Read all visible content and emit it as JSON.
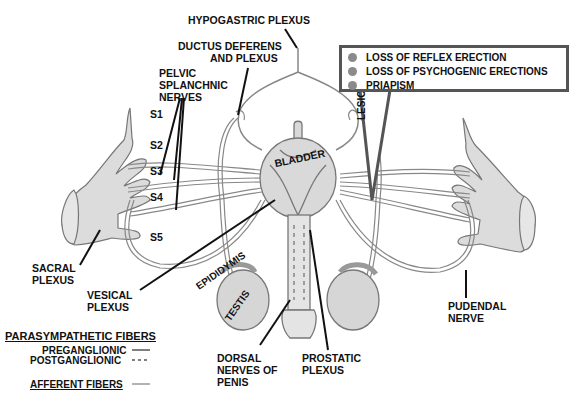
{
  "labels": {
    "hypogastric_plexus": "HYPOGASTRIC PLEXUS",
    "ductus_deferens_1": "DUCTUS DEFERENS",
    "ductus_deferens_2": "AND PLEXUS",
    "pelvic_1": "PELVIC",
    "pelvic_2": "SPLANCHNIC",
    "pelvic_3": "NERVES",
    "s1": "S1",
    "s2": "S2",
    "s3": "S3",
    "s4": "S4",
    "s5": "S5",
    "sacral_1": "SACRAL",
    "sacral_2": "PLEXUS",
    "vesical_1": "VESICAL",
    "vesical_2": "PLEXUS",
    "bladder": "BLADDER",
    "epididymis": "EPIDIDYMIS",
    "testis": "TESTIS",
    "lesion": "LESION",
    "dorsal_1": "DORSAL",
    "dorsal_2": "NERVES OF",
    "dorsal_3": "PENIS",
    "prostatic_1": "PROSTATIC",
    "prostatic_2": "PLEXUS",
    "pudendal_1": "PUDENDAL",
    "pudendal_2": "NERVE"
  },
  "lesion_effects": [
    "LOSS OF REFLEX ERECTION",
    "LOSS OF PSYCHOGENIC ERECTIONS",
    "PRIAPISM"
  ],
  "legend": {
    "parasympathetic_title": "PARASYMPATHETIC FIBERS",
    "preganglionic": "PREGANGLIONIC",
    "postganglionic": "POSTGANGLIONIC",
    "afferent_title": "AFFERENT FIBERS"
  },
  "colors": {
    "organ_fill": "#d9d9d9",
    "nerve_stroke": "#777777",
    "box_border": "#555555",
    "bullet": "#8a8a8a"
  }
}
